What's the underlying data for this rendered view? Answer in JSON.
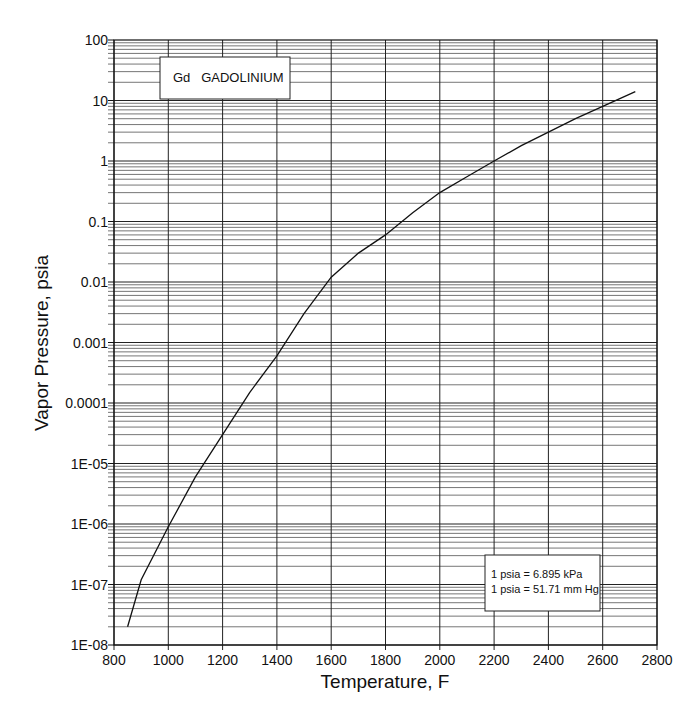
{
  "chart_data": {
    "type": "line",
    "title": "Gd GADOLINIUM",
    "xlabel": "Temperature, F",
    "ylabel": "Vapor Pressure, psia",
    "xlim": [
      800,
      2800
    ],
    "ylim": [
      1e-08,
      100
    ],
    "yscale": "log",
    "grid": true,
    "x_ticks": [
      800,
      1000,
      1200,
      1400,
      1600,
      1800,
      2000,
      2200,
      2400,
      2600,
      2800
    ],
    "x_tick_labels": [
      "800",
      "1000",
      "1200",
      "1400",
      "1600",
      "1800",
      "2000",
      "2200",
      "2400",
      "2600",
      "2800"
    ],
    "y_ticks": [
      1e-08,
      1e-07,
      1e-06,
      1e-05,
      0.0001,
      0.001,
      0.01,
      0.1,
      1,
      10,
      100
    ],
    "y_tick_labels": [
      "1E-08",
      "1E-07",
      "1E-06",
      "1E-05",
      "0.0001",
      "0.001",
      "0.01",
      "0.1",
      "1",
      "10",
      "100"
    ],
    "series": [
      {
        "name": "Gd vapor pressure",
        "x": [
          850,
          900,
          1000,
          1100,
          1200,
          1300,
          1400,
          1500,
          1600,
          1700,
          1800,
          1900,
          2000,
          2100,
          2200,
          2300,
          2400,
          2500,
          2600,
          2720
        ],
        "y": [
          2e-08,
          1.2e-07,
          9e-07,
          6e-06,
          3e-05,
          0.00015,
          0.0006,
          0.003,
          0.012,
          0.03,
          0.06,
          0.14,
          0.3,
          0.55,
          1.0,
          1.8,
          3.0,
          5.0,
          8.0,
          14.0
        ]
      }
    ],
    "annotations": [
      {
        "text": "Gd   GADOLINIUM",
        "position": "top-left box"
      },
      {
        "text": "1 psia = 6.895 kPa",
        "position": "bottom-right box"
      },
      {
        "text": "1 psia = 51.71 mm Hg",
        "position": "bottom-right box"
      }
    ],
    "legend": "none"
  },
  "labels": {
    "title_box": "Gd   GADOLINIUM",
    "conversion_line1": "1 psia = 6.895 kPa",
    "conversion_line2": "1 psia = 51.71 mm Hg",
    "xlabel": "Temperature, F",
    "ylabel": "Vapor Pressure, psia"
  },
  "colors": {
    "line": "#111111",
    "grid": "#555555",
    "background": "#ffffff"
  }
}
